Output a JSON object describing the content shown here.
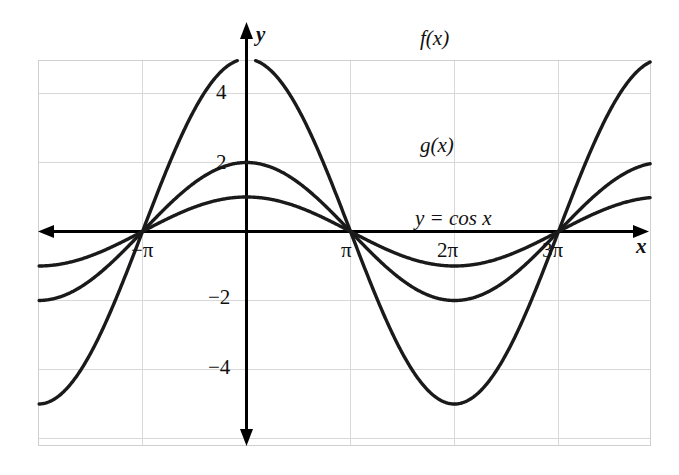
{
  "figure": {
    "background_color": "#ffffff",
    "frame_color": "#cfcfcf",
    "grid_color": "#d8d8d8",
    "curve_color": "#1a1a1a",
    "axis_color": "#000000"
  },
  "axis_names": {
    "x": "x",
    "y": "y"
  },
  "x_ticks": [
    {
      "label": "−π",
      "x": -3.14159
    },
    {
      "label": "π",
      "x": 3.14159
    },
    {
      "label": "2π",
      "x": 6.28319
    },
    {
      "label": "3π",
      "x": 9.42478
    }
  ],
  "y_ticks": [
    {
      "label": "4",
      "y": 4
    },
    {
      "label": "2",
      "y": 2
    },
    {
      "label": "−2",
      "y": -2
    },
    {
      "label": "−4",
      "y": -4
    }
  ],
  "annotations": [
    {
      "name": "f-label",
      "text": "f(x)"
    },
    {
      "name": "g-label",
      "text": "g(x)"
    },
    {
      "name": "cos-label",
      "text": "y = cos x"
    }
  ],
  "chart_data": {
    "type": "line",
    "title": "",
    "xlabel": "x",
    "ylabel": "y",
    "xlim": [
      -6.283,
      12.252
    ],
    "ylim": [
      -6.3,
      6.3
    ],
    "grid": true,
    "grid_x_step": 1.5708,
    "grid_y_step": 2,
    "legend": "inline-curve-labels",
    "series": [
      {
        "name": "f(x)",
        "label": "f(x)",
        "expression": "5 cos x",
        "amplitude": 5,
        "period": 6.28319,
        "color": "#1a1a1a",
        "key_points": [
          {
            "x": -6.283,
            "y": 5
          },
          {
            "x": -4.712,
            "y": 0
          },
          {
            "x": -3.142,
            "y": -5
          },
          {
            "x": -1.571,
            "y": 0
          },
          {
            "x": 0,
            "y": 5
          },
          {
            "x": 1.571,
            "y": 0
          },
          {
            "x": 3.142,
            "y": -5
          },
          {
            "x": 4.712,
            "y": 0
          },
          {
            "x": 6.283,
            "y": 5
          },
          {
            "x": 7.854,
            "y": 0
          },
          {
            "x": 9.425,
            "y": -5
          },
          {
            "x": 10.996,
            "y": 0
          },
          {
            "x": 12.252,
            "y": 4.05
          }
        ]
      },
      {
        "name": "g(x)",
        "label": "g(x)",
        "expression": "2 cos x",
        "amplitude": 2,
        "period": 6.28319,
        "color": "#1a1a1a",
        "key_points": [
          {
            "x": -6.283,
            "y": 2
          },
          {
            "x": -4.712,
            "y": 0
          },
          {
            "x": -3.142,
            "y": -2
          },
          {
            "x": -1.571,
            "y": 0
          },
          {
            "x": 0,
            "y": 2
          },
          {
            "x": 1.571,
            "y": 0
          },
          {
            "x": 3.142,
            "y": -2
          },
          {
            "x": 4.712,
            "y": 0
          },
          {
            "x": 6.283,
            "y": 2
          },
          {
            "x": 7.854,
            "y": 0
          },
          {
            "x": 9.425,
            "y": -2
          },
          {
            "x": 10.996,
            "y": 0
          },
          {
            "x": 12.252,
            "y": 1.62
          }
        ]
      },
      {
        "name": "cos",
        "label": "y = cos x",
        "expression": "cos x",
        "amplitude": 1,
        "period": 6.28319,
        "color": "#1a1a1a",
        "key_points": [
          {
            "x": -6.283,
            "y": 1
          },
          {
            "x": -4.712,
            "y": 0
          },
          {
            "x": -3.142,
            "y": -1
          },
          {
            "x": -1.571,
            "y": 0
          },
          {
            "x": 0,
            "y": 1
          },
          {
            "x": 1.571,
            "y": 0
          },
          {
            "x": 3.142,
            "y": -1
          },
          {
            "x": 4.712,
            "y": 0
          },
          {
            "x": 6.283,
            "y": 1
          },
          {
            "x": 7.854,
            "y": 0
          },
          {
            "x": 9.425,
            "y": -1
          },
          {
            "x": 10.996,
            "y": 0
          },
          {
            "x": 12.252,
            "y": 0.81
          }
        ]
      }
    ]
  }
}
